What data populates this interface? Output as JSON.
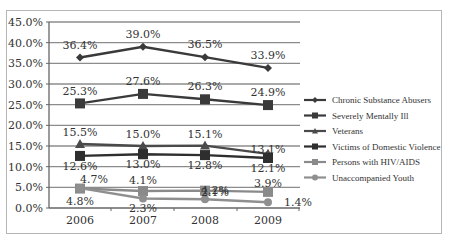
{
  "chart_data": {
    "type": "line",
    "title": "",
    "xlabel": "",
    "ylabel": "",
    "categories": [
      "2006",
      "2007",
      "2008",
      "2009"
    ],
    "ylim": [
      0,
      45
    ],
    "yticks": [
      "0.0%",
      "5.0%",
      "10.0%",
      "15.0%",
      "20.0%",
      "25.0%",
      "30.0%",
      "35.0%",
      "40.0%",
      "45.0%"
    ],
    "grid": true,
    "legend_position": "right",
    "series": [
      {
        "name": "Chronic Substance Abusers",
        "values": [
          36.4,
          39.0,
          36.5,
          33.9
        ],
        "labels": [
          "36.4%",
          "39.0%",
          "36.5%",
          "33.9%"
        ],
        "color": "#3a3a3a",
        "marker": "diamond"
      },
      {
        "name": "Severely Mentally Ill",
        "values": [
          25.3,
          27.6,
          26.3,
          24.9
        ],
        "labels": [
          "25.3%",
          "27.6%",
          "26.3%",
          "24.9%"
        ],
        "color": "#3a3a3a",
        "marker": "square"
      },
      {
        "name": "Veterans",
        "values": [
          15.5,
          15.0,
          15.1,
          13.1
        ],
        "labels": [
          "15.5%",
          "15.0%",
          "15.1%",
          "13.1%"
        ],
        "color": "#4a4a4a",
        "marker": "triangle"
      },
      {
        "name": "Victims of Domestic Violence",
        "values": [
          12.6,
          13.0,
          12.8,
          12.1
        ],
        "labels": [
          "12.6%",
          "13.0%",
          "12.8%",
          "12.1%"
        ],
        "color": "#2e2e2e",
        "marker": "square"
      },
      {
        "name": "Persons with HIV/AIDS",
        "values": [
          4.7,
          4.1,
          4.2,
          3.9
        ],
        "labels": [
          "4.7%",
          "4.1%",
          "4.2%",
          "3.9%"
        ],
        "color": "#8a8a8a",
        "marker": "square"
      },
      {
        "name": "Unaccompanied Youth",
        "values": [
          4.8,
          2.3,
          2.1,
          1.4
        ],
        "labels": [
          "4.8%",
          "2.3%",
          "2.1%",
          "1.4%"
        ],
        "color": "#8f8f8f",
        "marker": "circle"
      }
    ]
  }
}
